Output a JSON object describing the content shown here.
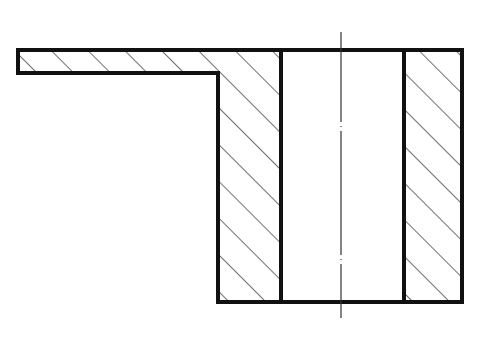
{
  "drawing": {
    "type": "sectional view",
    "description": "Cross-section of a flanged bushing with a through bore and a thin side flange",
    "colors": {
      "background": "#ffffff",
      "outline": "#111111",
      "hatch": "#222222",
      "centerline": "#333333"
    },
    "geometry": {
      "top_y": 50,
      "bottom_y": 302,
      "flange_left_x": 18,
      "flange_bottom_y": 73,
      "step_x": 218,
      "bore_left_x": 281,
      "bore_right_x": 404,
      "outer_right_x": 462,
      "centerline_x": 341,
      "centerline_top_y": 32,
      "centerline_bottom_y": 318
    },
    "regions": [
      {
        "name": "flange",
        "hatched": true
      },
      {
        "name": "left-wall",
        "hatched": true
      },
      {
        "name": "bore",
        "hatched": false
      },
      {
        "name": "right-wall",
        "hatched": true
      }
    ],
    "hatch_angle_deg": 45,
    "hatch_spacing_px": 26
  }
}
